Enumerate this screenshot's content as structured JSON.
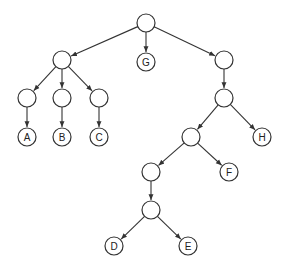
{
  "diagram": {
    "type": "tree",
    "nodes": [
      {
        "id": "root",
        "label": "",
        "x": 146,
        "y": 23
      },
      {
        "id": "n1",
        "label": "",
        "x": 62,
        "y": 60
      },
      {
        "id": "G",
        "label": "G",
        "x": 146,
        "y": 62
      },
      {
        "id": "n2",
        "label": "",
        "x": 224,
        "y": 60
      },
      {
        "id": "n3",
        "label": "",
        "x": 27,
        "y": 98
      },
      {
        "id": "n4",
        "label": "",
        "x": 62,
        "y": 98
      },
      {
        "id": "n5",
        "label": "",
        "x": 99,
        "y": 98
      },
      {
        "id": "A",
        "label": "A",
        "x": 27,
        "y": 137
      },
      {
        "id": "B",
        "label": "B",
        "x": 62,
        "y": 137
      },
      {
        "id": "C",
        "label": "C",
        "x": 99,
        "y": 137
      },
      {
        "id": "n6",
        "label": "",
        "x": 224,
        "y": 98
      },
      {
        "id": "n7",
        "label": "",
        "x": 191,
        "y": 137
      },
      {
        "id": "H",
        "label": "H",
        "x": 262,
        "y": 137
      },
      {
        "id": "n8",
        "label": "",
        "x": 151,
        "y": 172
      },
      {
        "id": "F",
        "label": "F",
        "x": 229,
        "y": 172
      },
      {
        "id": "n9",
        "label": "",
        "x": 151,
        "y": 210
      },
      {
        "id": "D",
        "label": "D",
        "x": 114,
        "y": 246
      },
      {
        "id": "E",
        "label": "E",
        "x": 188,
        "y": 246
      }
    ],
    "edges": [
      [
        "root",
        "n1"
      ],
      [
        "root",
        "G"
      ],
      [
        "root",
        "n2"
      ],
      [
        "n1",
        "n3"
      ],
      [
        "n1",
        "n4"
      ],
      [
        "n1",
        "n5"
      ],
      [
        "n3",
        "A"
      ],
      [
        "n4",
        "B"
      ],
      [
        "n5",
        "C"
      ],
      [
        "n2",
        "n6"
      ],
      [
        "n6",
        "n7"
      ],
      [
        "n6",
        "H"
      ],
      [
        "n7",
        "n8"
      ],
      [
        "n7",
        "F"
      ],
      [
        "n8",
        "n9"
      ],
      [
        "n9",
        "D"
      ],
      [
        "n9",
        "E"
      ]
    ],
    "node_radius": 9,
    "stroke_color": "#333333"
  }
}
